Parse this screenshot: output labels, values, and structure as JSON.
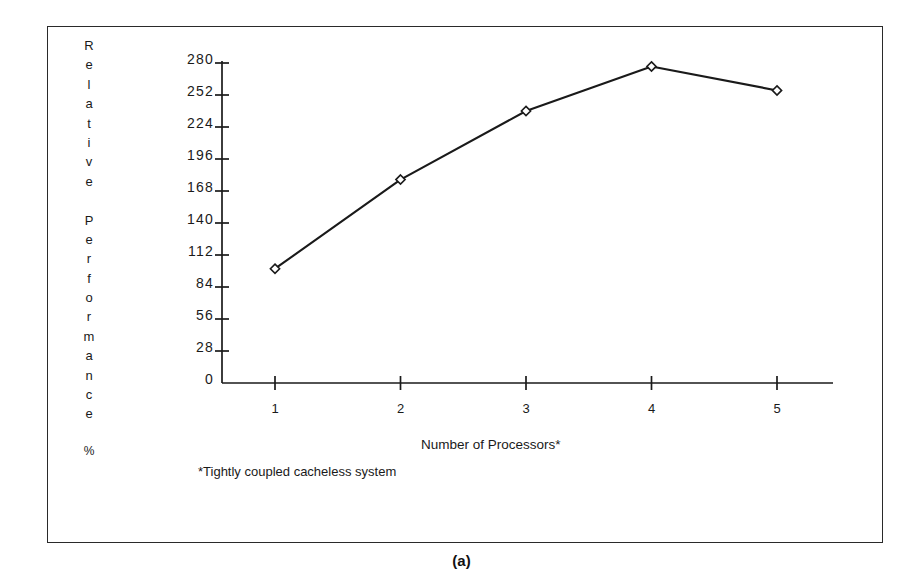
{
  "figure": {
    "caption": "(a)",
    "footnote": "*Tightly coupled cacheless system",
    "frame_color": "#2a2a2a",
    "background": "#ffffff"
  },
  "chart_data": {
    "type": "line",
    "title": "",
    "xlabel": "Number of Processors*",
    "ylabel": "Relative Performance %",
    "ylabel_letters": [
      "R",
      "e",
      "l",
      "a",
      "t",
      "i",
      "v",
      "e",
      "",
      "P",
      "e",
      "r",
      "f",
      "o",
      "r",
      "m",
      "a",
      "n",
      "c",
      "e"
    ],
    "ylabel_unit": "%",
    "x": [
      1,
      2,
      3,
      4,
      5
    ],
    "values": [
      100,
      178,
      238,
      277,
      256
    ],
    "categories": [
      "1",
      "2",
      "3",
      "4",
      "5"
    ],
    "xtick_labels": [
      "1",
      "2",
      "3",
      "4",
      "5"
    ],
    "ytick_labels": [
      "0",
      "28",
      "56",
      "84",
      "112",
      "140",
      "168",
      "196",
      "224",
      "252",
      "280"
    ],
    "ytick_values": [
      0,
      28,
      56,
      84,
      112,
      140,
      168,
      196,
      224,
      252,
      280
    ],
    "ylim": [
      0,
      280
    ],
    "xlim": [
      0.6,
      5.6
    ],
    "grid": false,
    "legend": false,
    "marker": "diamond-open",
    "line_color": "#1a1a1a",
    "marker_fill": "#ffffff",
    "axis_color": "#1a1a1a"
  }
}
